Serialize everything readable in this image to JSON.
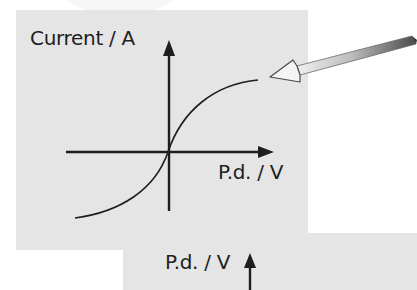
{
  "figure": {
    "type": "current-voltage characteristic graph",
    "top_graph": {
      "y_axis_label": "Current / A",
      "x_axis_label": "P.d. / V",
      "curve": "S-shaped curve through origin, levelling off at high positive and negative p.d."
    },
    "pointer_arrow": {
      "description": "3D pencil-style arrow pointing at upper end of curve"
    },
    "bottom_graph": {
      "y_axis_label": "P.d. / V"
    }
  },
  "colors": {
    "panel_background": "#e5e5e5",
    "page_background": "#ffffff",
    "axis_color": "#1e1e1e",
    "arrow_shaft_light": "#e6e6e6",
    "arrow_shaft_dark": "#555555"
  }
}
